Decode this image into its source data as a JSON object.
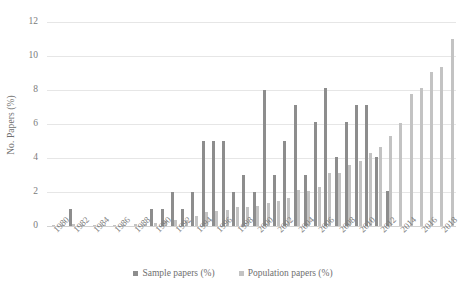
{
  "chart_data": {
    "type": "bar",
    "title": "",
    "xlabel": "",
    "ylabel": "No. Papers (%)",
    "ylim": [
      0,
      12
    ],
    "yticks": [
      0,
      2,
      4,
      6,
      8,
      10,
      12
    ],
    "grid": true,
    "legend_position": "bottom",
    "categories": [
      "1980",
      "1981",
      "1982",
      "1983",
      "1984",
      "1985",
      "1986",
      "1987",
      "1988",
      "1989",
      "1990",
      "1991",
      "1992",
      "1993",
      "1994",
      "1995",
      "1996",
      "1997",
      "1998",
      "1999",
      "2000",
      "2001",
      "2002",
      "2003",
      "2004",
      "2005",
      "2006",
      "2007",
      "2008",
      "2009",
      "2010",
      "2011",
      "2012",
      "2013",
      "2014",
      "2015",
      "2016",
      "2017",
      "2018",
      "2019"
    ],
    "xtick_labels": [
      "1980",
      "1982",
      "1984",
      "1986",
      "1988",
      "1990",
      "1992",
      "1994",
      "1996",
      "1998",
      "2000",
      "2002",
      "2004",
      "2006",
      "2008",
      "2010",
      "2012",
      "2014",
      "2016",
      "2018"
    ],
    "series": [
      {
        "name": "Sample papers (%)",
        "color": "#8d8d8d",
        "values": [
          0,
          0,
          1.0,
          0,
          0,
          0,
          0,
          0,
          0,
          0,
          1.0,
          1.0,
          2.0,
          1.0,
          2.0,
          5.0,
          5.0,
          5.0,
          2.0,
          3.0,
          2.0,
          8.0,
          3.0,
          5.0,
          7.1,
          3.0,
          6.1,
          8.1,
          4.05,
          6.1,
          7.1,
          7.1,
          4.05,
          2.05,
          0,
          0,
          0,
          0,
          0,
          0
        ]
      },
      {
        "name": "Population papers (%)",
        "color": "#c3c3c3",
        "values": [
          0.05,
          0.08,
          0.1,
          0.07,
          0.08,
          0.05,
          0.06,
          0.08,
          0.1,
          0.12,
          0.2,
          0.28,
          0.35,
          0.38,
          0.6,
          0.8,
          0.9,
          0.92,
          1.12,
          1.12,
          1.15,
          1.35,
          1.45,
          1.65,
          2.1,
          2.05,
          2.3,
          3.1,
          3.1,
          3.6,
          3.85,
          4.3,
          4.65,
          5.3,
          6.05,
          7.75,
          8.1,
          9.05,
          9.35,
          11.0
        ]
      }
    ]
  },
  "legend": {
    "items": [
      {
        "label": "Sample papers (%)",
        "swatch": "legend-swatch-sample"
      },
      {
        "label": "Population papers (%)",
        "swatch": "legend-swatch-population"
      }
    ]
  },
  "axes": {
    "y_title": "No. Papers (%)"
  }
}
